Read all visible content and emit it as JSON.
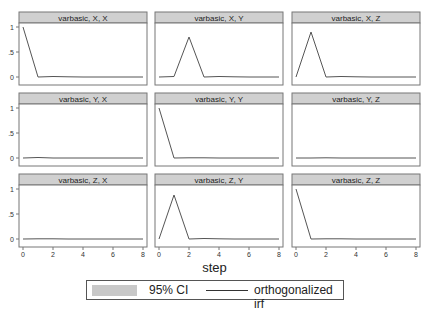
{
  "chart_data": {
    "type": "line",
    "layout": "3x3 facet grid",
    "xlabel": "step",
    "x": [
      0,
      1,
      2,
      3,
      4,
      5,
      6,
      7,
      8
    ],
    "xticks": [
      0,
      2,
      4,
      6,
      8
    ],
    "yticks": [
      0,
      0.5,
      1
    ],
    "ytick_labels": [
      "0",
      ".5",
      "1"
    ],
    "ylim": [
      -0.1,
      1.1
    ],
    "grid": false,
    "legend": {
      "position": "bottom",
      "entries": [
        "95% CI",
        "orthogonalized irf"
      ]
    },
    "panels": [
      {
        "title": "varbasic, X, X",
        "values": [
          1,
          0,
          0.01,
          0.005,
          0,
          0,
          0,
          0,
          0
        ]
      },
      {
        "title": "varbasic, X, Y",
        "values": [
          0,
          0.01,
          0.8,
          0,
          0.01,
          0.005,
          0,
          0,
          0
        ]
      },
      {
        "title": "varbasic, X, Z",
        "values": [
          0,
          0.9,
          0,
          0.01,
          0.005,
          0,
          0,
          0,
          0
        ]
      },
      {
        "title": "varbasic, Y, X",
        "values": [
          0,
          0.01,
          0,
          0,
          0,
          0,
          0,
          0,
          0
        ]
      },
      {
        "title": "varbasic, Y, Y",
        "values": [
          1,
          0,
          0.005,
          0.005,
          0,
          0,
          0,
          0,
          0
        ]
      },
      {
        "title": "varbasic, Y, Z",
        "values": [
          0,
          0,
          0.005,
          0,
          0,
          0,
          0,
          0,
          0
        ]
      },
      {
        "title": "varbasic, Z, X",
        "values": [
          0,
          0.005,
          0.005,
          0,
          0,
          0,
          0,
          0,
          0
        ]
      },
      {
        "title": "varbasic, Z, Y",
        "values": [
          0,
          0.88,
          0,
          0.01,
          0.005,
          0,
          0,
          0,
          0
        ]
      },
      {
        "title": "varbasic, Z, Z",
        "values": [
          1,
          0,
          0.005,
          0.005,
          0,
          0,
          0,
          0,
          0
        ]
      }
    ]
  },
  "legend": {
    "ci_label": "95% CI",
    "irf_label": "orthogonalized irf"
  },
  "axis": {
    "xlabel": "step"
  },
  "colors": {
    "header_bg": "#d0d0d0",
    "line": "#555555",
    "ci": "#c8c8c8",
    "frame": "#777777"
  }
}
